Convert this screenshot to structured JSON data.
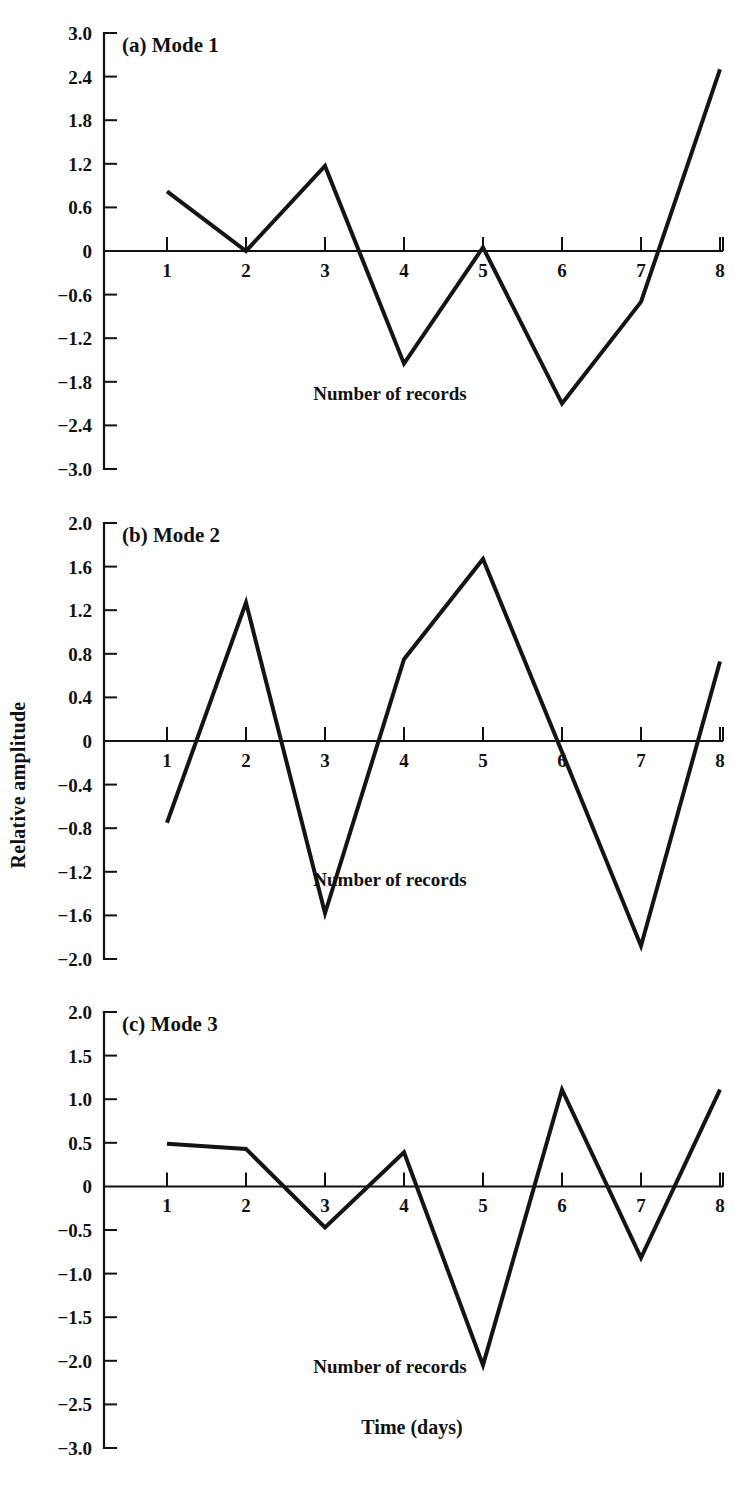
{
  "figure": {
    "y_axis_title": "Relative amplitude",
    "x_axis_title": "Time (days)",
    "inner_x_label": "Number of records"
  },
  "chart_data": [
    {
      "type": "line",
      "title": "(a) Mode 1",
      "panel": "a",
      "xlabel": "Number of records",
      "ylabel": "Relative amplitude",
      "x": [
        1,
        2,
        3,
        4,
        5,
        6,
        7,
        8
      ],
      "values": [
        0.82,
        0.0,
        1.17,
        -1.55,
        0.05,
        -2.1,
        -0.7,
        2.5
      ],
      "xlim": [
        1,
        8
      ],
      "ylim": [
        -3.0,
        3.0
      ],
      "ytick_labels": [
        "3.0",
        "2.4",
        "1.8",
        "1.2",
        "0.6",
        "0",
        "-0.6",
        "-1.2",
        "-1.8",
        "-2.4",
        "-3.0"
      ],
      "ytick_values": [
        3.0,
        2.4,
        1.8,
        1.2,
        0.6,
        0,
        -0.6,
        -1.2,
        -1.8,
        -2.4,
        -3.0
      ],
      "xtick_labels": [
        "1",
        "2",
        "3",
        "4",
        "5",
        "6",
        "7",
        "8"
      ],
      "grid": false,
      "legend": "none"
    },
    {
      "type": "line",
      "title": "(b) Mode 2",
      "panel": "b",
      "xlabel": "Number of records",
      "ylabel": "Relative amplitude",
      "x": [
        1,
        2,
        3,
        4,
        5,
        6,
        7,
        8
      ],
      "values": [
        -0.75,
        1.27,
        -1.58,
        0.75,
        1.67,
        -0.1,
        -1.88,
        0.73
      ],
      "xlim": [
        1,
        8
      ],
      "ylim": [
        -2.0,
        2.0
      ],
      "ytick_labels": [
        "2.0",
        "1.6",
        "1.2",
        "0.8",
        "0.4",
        "0",
        "-0.4",
        "-0.8",
        "-1.2",
        "-1.6",
        "-2.0"
      ],
      "ytick_values": [
        2.0,
        1.6,
        1.2,
        0.8,
        0.4,
        0,
        -0.4,
        -0.8,
        -1.2,
        -1.6,
        -2.0
      ],
      "xtick_labels": [
        "1",
        "2",
        "3",
        "4",
        "5",
        "6",
        "7",
        "8"
      ],
      "grid": false,
      "legend": "none"
    },
    {
      "type": "line",
      "title": "(c) Mode 3",
      "panel": "c",
      "xlabel": "Time (days)",
      "ylabel": "Relative amplitude",
      "x": [
        1,
        2,
        3,
        4,
        5,
        6,
        7,
        8
      ],
      "values": [
        0.49,
        0.43,
        -0.47,
        0.39,
        -2.05,
        1.11,
        -0.82,
        1.11
      ],
      "xlim": [
        1,
        8
      ],
      "ylim": [
        -3.0,
        2.0
      ],
      "ytick_labels": [
        "2.0",
        "1.5",
        "1.0",
        "0.5",
        "0",
        "-0.5",
        "-1.0",
        "-1.5",
        "-2.0",
        "-2.5",
        "-3.0"
      ],
      "ytick_values": [
        2.0,
        1.5,
        1.0,
        0.5,
        0,
        -0.5,
        -1.0,
        -1.5,
        -2.0,
        -2.5,
        -3.0
      ],
      "xtick_labels": [
        "1",
        "2",
        "3",
        "4",
        "5",
        "6",
        "7",
        "8"
      ],
      "grid": false,
      "legend": "none"
    }
  ]
}
